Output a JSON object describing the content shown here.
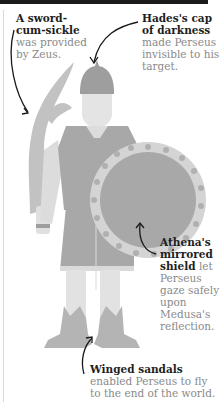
{
  "captions": {
    "sword": {
      "bold": "A sword-cum-sickle",
      "rest": " was provided by Zeus."
    },
    "cap": {
      "bold": "Hades's cap of darkness",
      "rest": " made Perseus invisible to his target."
    },
    "shield": {
      "bold": "Athena's mirrored shield",
      "rest": " let Perseus gaze safely upon Medusa's reflection."
    },
    "sandals": {
      "bold": "Winged sandals",
      "rest": " enabled Perseus to fly to the end of the world."
    }
  },
  "colors": {
    "dark_fill": "#9e9e9e",
    "mid_fill": "#b4b4b4",
    "light_fill": "#d4d4d4",
    "skin_fill": "#e4e4e4",
    "arrow": "#1a1a1a",
    "bold_text": "#1e1e1e",
    "body_text": "#8a8a8a"
  }
}
